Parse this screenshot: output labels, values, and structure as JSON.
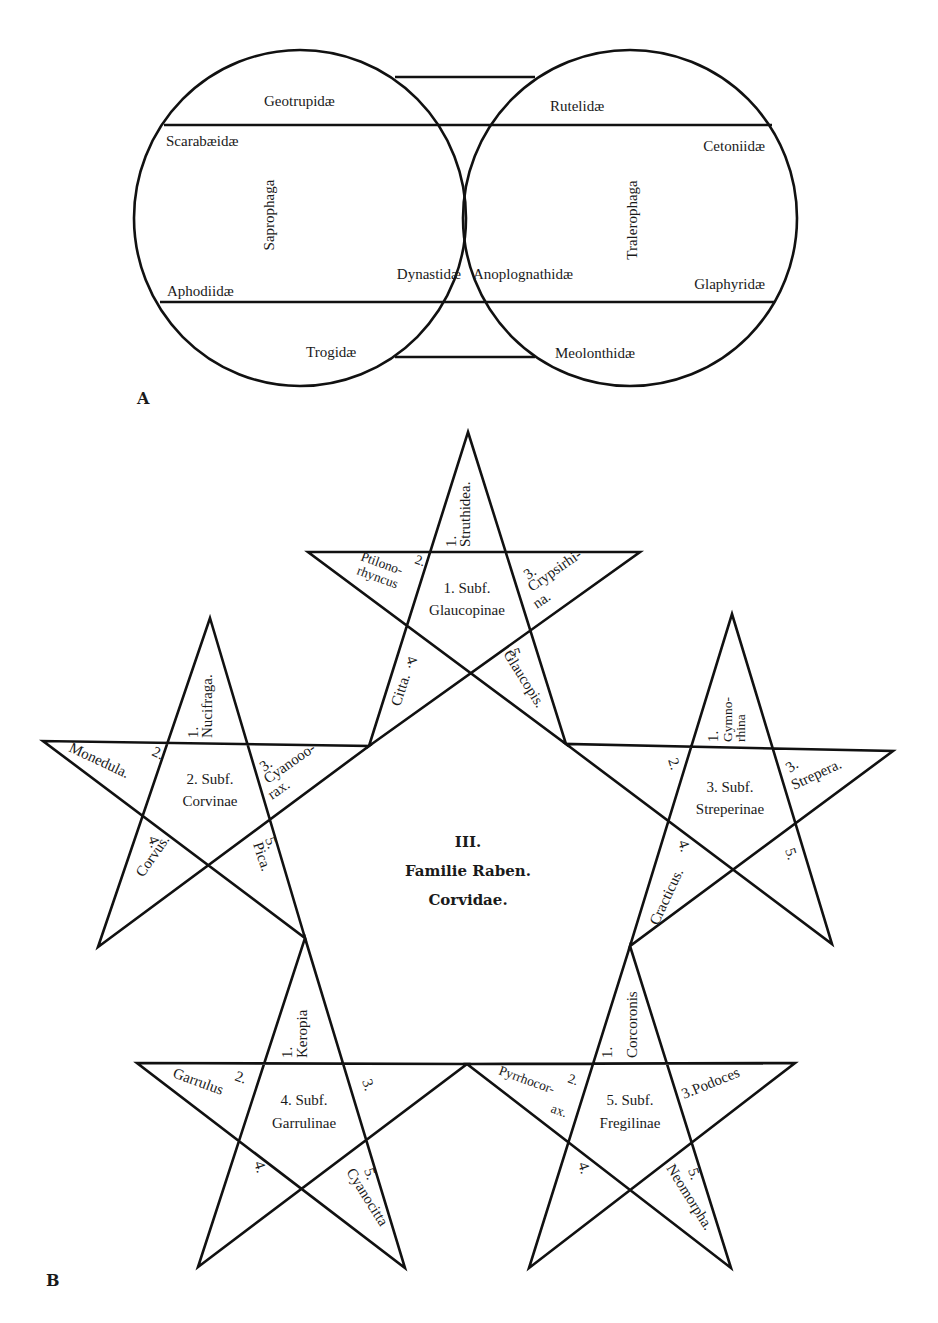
{
  "figure": {
    "panel_a_label": "A",
    "panel_b_label": "B"
  },
  "panel_a": {
    "left_circle": {
      "group": "Saprophaga",
      "families": {
        "top": "Geotrupidæ",
        "upper_left": "Scarabæidæ",
        "middle_right": "Dynastidæ",
        "lower_left": "Aphodiidæ",
        "bottom": "Trogidæ"
      }
    },
    "right_circle": {
      "group": "Tralerophaga",
      "families": {
        "top": "Rutelidæ",
        "upper_right": "Cetoniidæ",
        "middle_left": "Anoplognathidæ",
        "lower_right": "Glaphyridæ",
        "bottom": "Meolonthidæ"
      }
    }
  },
  "panel_b": {
    "center": {
      "line1": "III.",
      "line2": "Familie Raben.",
      "line3": "Corvidae."
    },
    "stars": [
      {
        "subfamily_line1": "1. Subf.",
        "subfamily_line2": "Glaucopinae",
        "points": {
          "p1_num": "1.",
          "p1_name": "Struthidea.",
          "p2_num": "2.",
          "p2_name_a": "Ptilono-",
          "p2_name_b": "rhyncus",
          "p3_num": "3.",
          "p3_name_a": "Crypsirhi-",
          "p3_name_b": "na.",
          "p4_num": "4.",
          "p4_name": "Citta.",
          "p5_num": "5.",
          "p5_name": "Glaucopis."
        }
      },
      {
        "subfamily_line1": "2. Subf.",
        "subfamily_line2": "Corvinae",
        "points": {
          "p1_num": "1.",
          "p1_name": "Nucifraga.",
          "p2_num": "2.",
          "p2_name": "Monedula.",
          "p3_num": "3.",
          "p3_name_a": "Cyanooo-",
          "p3_name_b": "rax.",
          "p4_num": "4.",
          "p4_name": "Corvus.",
          "p5_num": "5.",
          "p5_name": "Pica."
        }
      },
      {
        "subfamily_line1": "3. Subf.",
        "subfamily_line2": "Streperinae",
        "points": {
          "p1_num": "1.",
          "p1_name_a": "Gymno-",
          "p1_name_b": "rhina",
          "p2_num": "2.",
          "p3_num": "3.",
          "p3_name": "Strepera.",
          "p4_num": "4.",
          "p4_name": "Cracticus.",
          "p5_num": "5."
        }
      },
      {
        "subfamily_line1": "4. Subf.",
        "subfamily_line2": "Garrulinae",
        "points": {
          "p1_num": "1.",
          "p1_name": "Keropia",
          "p2_num": "2.",
          "p2_name": "Garrulus",
          "p3_num": "3.",
          "p4_num": "4.",
          "p5_num": "5.",
          "p5_name": "Cyanocitta"
        }
      },
      {
        "subfamily_line1": "5. Subf.",
        "subfamily_line2": "Fregilinae",
        "points": {
          "p1_num": "1.",
          "p1_name": "Corcoronis",
          "p2_num": "2.",
          "p2_name_a": "Pyrrhocor-",
          "p2_name_b": "ax.",
          "p3_label": "3.Podoces",
          "p4_num": "4.",
          "p5_num": "5.",
          "p5_name": "Neomorpha."
        }
      }
    ]
  }
}
